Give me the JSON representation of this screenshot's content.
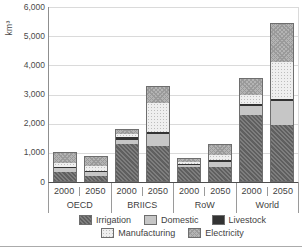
{
  "y_axis": {
    "unit": "km³",
    "max": 6000,
    "tick_values": [
      0,
      1000,
      2000,
      3000,
      4000,
      5000,
      6000
    ],
    "tick_labels": [
      "0",
      "1,000",
      "2,000",
      "3,000",
      "4,000",
      "5,000",
      "6,000"
    ]
  },
  "x_axis": {
    "groups": [
      {
        "label": "OECD",
        "years": [
          "2000",
          "2050"
        ]
      },
      {
        "label": "BRIICS",
        "years": [
          "2000",
          "2050"
        ]
      },
      {
        "label": "RoW",
        "years": [
          "2000",
          "2050"
        ]
      },
      {
        "label": "World",
        "years": [
          "2000",
          "2050"
        ]
      }
    ]
  },
  "legend": {
    "rows": [
      [
        {
          "key": "irrigation",
          "label": "Irrigation"
        },
        {
          "key": "domestic",
          "label": "Domestic"
        },
        {
          "key": "livestock",
          "label": "Livestock"
        }
      ],
      [
        {
          "key": "manufacturing",
          "label": "Manufacturing"
        },
        {
          "key": "electricity",
          "label": "Electricity"
        }
      ]
    ]
  },
  "colors": {
    "irrigation": "#6f6f6f",
    "domestic": "#c6c6c6",
    "livestock": "#333333",
    "manufacturing": "#efefef",
    "electricity": "#b4b4b4",
    "grid": "#dadada",
    "axis": "#8f8f8f",
    "baseline": "#4f4f4f",
    "bar_outline": "#6e6e6e",
    "text": "#3f3f3f"
  },
  "chart_data": {
    "type": "bar",
    "stacked": true,
    "title": "",
    "ylabel": "km³",
    "ylim": [
      0,
      6000
    ],
    "grid": true,
    "legend_position": "bottom",
    "categories": [
      "OECD 2000",
      "OECD 2050",
      "BRIICS 2000",
      "BRIICS 2050",
      "RoW 2000",
      "RoW 2050",
      "World 2000",
      "World 2050"
    ],
    "series": [
      {
        "name": "Irrigation",
        "key": "irrigation",
        "values": [
          320,
          180,
          1330,
          1240,
          520,
          490,
          2300,
          1960
        ]
      },
      {
        "name": "Domestic",
        "key": "domestic",
        "values": [
          160,
          150,
          140,
          410,
          90,
          200,
          320,
          830
        ]
      },
      {
        "name": "Livestock",
        "key": "livestock",
        "values": [
          50,
          50,
          90,
          80,
          40,
          60,
          80,
          60
        ]
      },
      {
        "name": "Manufacturing",
        "key": "manufacturing",
        "values": [
          120,
          160,
          120,
          1000,
          60,
          210,
          290,
          1280
        ]
      },
      {
        "name": "Electricity",
        "key": "electricity",
        "values": [
          370,
          340,
          140,
          550,
          100,
          330,
          560,
          1330
        ]
      }
    ],
    "totals": [
      1020,
      880,
      1820,
      3280,
      810,
      1290,
      3550,
      5460
    ]
  }
}
